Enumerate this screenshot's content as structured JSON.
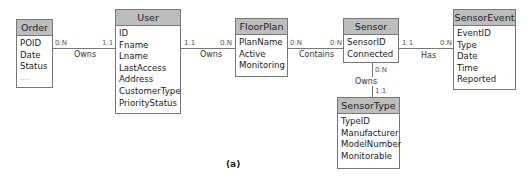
{
  "diagram": {
    "caption": "(a)",
    "entities": {
      "order": {
        "name": "Order",
        "attributes": [
          "POID",
          "Date",
          "Status",
          "...."
        ]
      },
      "user": {
        "name": "User",
        "attributes": [
          "ID",
          "Fname",
          "Lname",
          "LastAccess",
          "Address",
          "CustomerType",
          "PriorityStatus"
        ]
      },
      "floorplan": {
        "name": "FloorPlan",
        "attributes": [
          "PlanName",
          "Active",
          "Monitoring"
        ]
      },
      "sensor": {
        "name": "Sensor",
        "attributes": [
          "SensorID",
          "Connected"
        ]
      },
      "sensorevent": {
        "name": "SensorEvent",
        "attributes": [
          "EventID",
          "Type",
          "Date",
          "Time",
          "Reported"
        ]
      },
      "sensortype": {
        "name": "SensorType",
        "attributes": [
          "TypeID",
          "Manufacturer",
          "ModelNumber",
          "Monitorable"
        ]
      }
    },
    "relationships": {
      "order_user": {
        "label": "Owns",
        "left_card": "0:N",
        "right_card": "1:1"
      },
      "user_floorplan": {
        "label": "Owns",
        "left_card": "1:1",
        "right_card": "0:N"
      },
      "floorplan_sensor": {
        "label": "Contains",
        "left_card": "0:N",
        "right_card": "0:N"
      },
      "sensor_sensorevent": {
        "label": "Has",
        "left_card": "1:1",
        "right_card": "0:N"
      },
      "sensor_sensortype": {
        "label": "Owns",
        "top_card": "0:N",
        "bottom_card": "1:1"
      }
    }
  }
}
